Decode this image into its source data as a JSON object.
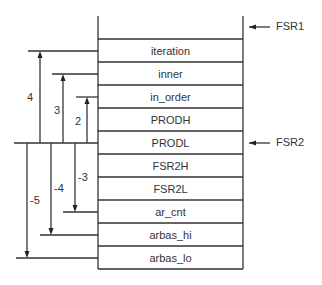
{
  "diagram": {
    "cells": [
      "iteration",
      "inner",
      "in_order",
      "PRODH",
      "PRODL",
      "FSR2H",
      "FSR2L",
      "ar_cnt",
      "arbas_hi",
      "arbas_lo"
    ],
    "pointers": [
      {
        "label": "FSR1",
        "row_y": 27
      },
      {
        "label": "FSR2",
        "row_y": 143
      }
    ],
    "offsets_up": [
      "4",
      "3",
      "2"
    ],
    "offsets_down": [
      "-3",
      "-4",
      "-5"
    ]
  }
}
